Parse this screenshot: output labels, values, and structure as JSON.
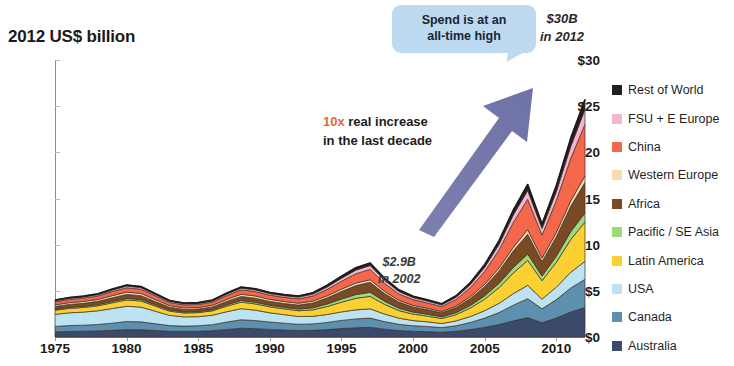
{
  "title": "2012 US$ billion",
  "annotations": {
    "callout": "Spend is at an\nall-time high",
    "callout_line1": "Spend is at an",
    "callout_line2": "all-time high",
    "peak_value": "$30B",
    "peak_year": "in 2012",
    "trough_value": "$2.9B",
    "trough_year": "in 2002",
    "increase_highlight": "10x",
    "increase_rest": " real increase",
    "increase_line2": "in the last decade",
    "arrow": "up-right-arrow"
  },
  "legend": {
    "items": [
      {
        "label": "Rest of World",
        "color": "#231f20"
      },
      {
        "label": "FSU + E Europe",
        "color": "#f4b6cd"
      },
      {
        "label": "China",
        "color": "#f4674a"
      },
      {
        "label": "Western Europe",
        "color": "#f6dcb0"
      },
      {
        "label": "Africa",
        "color": "#7a4a25"
      },
      {
        "label": "Pacific / SE Asia",
        "color": "#9ddb7a"
      },
      {
        "label": "Latin America",
        "color": "#fbd032"
      },
      {
        "label": "USA",
        "color": "#bde2f2"
      },
      {
        "label": "Canada",
        "color": "#5d8fae"
      },
      {
        "label": "Australia",
        "color": "#3b4a6b"
      }
    ]
  },
  "chart_data": {
    "type": "area",
    "stacked": true,
    "title": "2012 US$ billion",
    "xlabel": "",
    "ylabel": "2012 US$ billion",
    "ylim": [
      0,
      30
    ],
    "xlim": [
      1975,
      2012
    ],
    "ytick_labels": [
      "$0",
      "$5",
      "$10",
      "$15",
      "$20",
      "$25",
      "$30"
    ],
    "ytick_values": [
      0,
      5,
      10,
      15,
      20,
      25,
      30
    ],
    "xtick_labels": [
      "1975",
      "1980",
      "1985",
      "1990",
      "1995",
      "2000",
      "2005",
      "2010"
    ],
    "xtick_values": [
      1975,
      1980,
      1985,
      1990,
      1995,
      2000,
      2005,
      2010
    ],
    "grid": false,
    "legend_position": "right",
    "x": [
      1975,
      1976,
      1977,
      1978,
      1979,
      1980,
      1981,
      1982,
      1983,
      1984,
      1985,
      1986,
      1987,
      1988,
      1989,
      1990,
      1991,
      1992,
      1993,
      1994,
      1995,
      1996,
      1997,
      1998,
      1999,
      2000,
      2001,
      2002,
      2003,
      2004,
      2005,
      2006,
      2007,
      2008,
      2009,
      2010,
      2011,
      2012
    ],
    "series": [
      {
        "name": "Australia",
        "color": "#3b4a6b",
        "values": [
          0.55,
          0.6,
          0.62,
          0.66,
          0.72,
          0.8,
          0.78,
          0.7,
          0.62,
          0.6,
          0.62,
          0.68,
          0.82,
          0.95,
          0.9,
          0.82,
          0.76,
          0.7,
          0.72,
          0.8,
          0.92,
          1.0,
          1.05,
          0.85,
          0.7,
          0.62,
          0.58,
          0.52,
          0.62,
          0.8,
          1.05,
          1.35,
          1.75,
          2.1,
          1.55,
          2.05,
          2.7,
          3.2
        ]
      },
      {
        "name": "Canada",
        "color": "#5d8fae",
        "values": [
          0.6,
          0.64,
          0.66,
          0.7,
          0.78,
          0.88,
          0.86,
          0.74,
          0.62,
          0.58,
          0.6,
          0.66,
          0.8,
          0.92,
          0.88,
          0.8,
          0.74,
          0.68,
          0.7,
          0.78,
          0.88,
          0.96,
          1.0,
          0.82,
          0.68,
          0.6,
          0.56,
          0.5,
          0.6,
          0.78,
          1.0,
          1.3,
          1.7,
          2.05,
          1.5,
          2.0,
          2.6,
          3.05
        ]
      },
      {
        "name": "USA",
        "color": "#bde2f2",
        "values": [
          1.3,
          1.38,
          1.42,
          1.48,
          1.58,
          1.65,
          1.6,
          1.35,
          1.1,
          1.0,
          0.98,
          1.02,
          1.12,
          1.2,
          1.12,
          1.0,
          0.92,
          0.84,
          0.82,
          0.86,
          0.92,
          0.98,
          1.0,
          0.82,
          0.66,
          0.56,
          0.5,
          0.44,
          0.52,
          0.64,
          0.8,
          1.0,
          1.25,
          1.45,
          1.05,
          1.35,
          1.7,
          1.95
        ]
      },
      {
        "name": "Latin America",
        "color": "#fbd032",
        "values": [
          0.45,
          0.48,
          0.5,
          0.54,
          0.62,
          0.68,
          0.66,
          0.56,
          0.46,
          0.42,
          0.44,
          0.48,
          0.6,
          0.7,
          0.68,
          0.64,
          0.62,
          0.62,
          0.7,
          0.86,
          1.05,
          1.25,
          1.35,
          1.05,
          0.82,
          0.7,
          0.62,
          0.54,
          0.68,
          0.92,
          1.25,
          1.7,
          2.25,
          2.7,
          2.0,
          2.7,
          3.55,
          4.25
        ]
      },
      {
        "name": "Pacific / SE Asia",
        "color": "#9ddb7a",
        "values": [
          0.1,
          0.11,
          0.12,
          0.13,
          0.15,
          0.16,
          0.16,
          0.14,
          0.12,
          0.11,
          0.11,
          0.12,
          0.15,
          0.18,
          0.18,
          0.17,
          0.17,
          0.18,
          0.22,
          0.28,
          0.34,
          0.4,
          0.44,
          0.34,
          0.26,
          0.22,
          0.2,
          0.18,
          0.22,
          0.28,
          0.36,
          0.46,
          0.58,
          0.68,
          0.5,
          0.66,
          0.85,
          1.0
        ]
      },
      {
        "name": "Africa",
        "color": "#7a4a25",
        "values": [
          0.3,
          0.32,
          0.33,
          0.35,
          0.4,
          0.44,
          0.42,
          0.36,
          0.3,
          0.28,
          0.28,
          0.3,
          0.38,
          0.44,
          0.44,
          0.42,
          0.42,
          0.44,
          0.52,
          0.66,
          0.82,
          0.98,
          1.08,
          0.84,
          0.66,
          0.56,
          0.5,
          0.44,
          0.55,
          0.74,
          1.0,
          1.35,
          1.8,
          2.15,
          1.58,
          2.1,
          2.75,
          3.3
        ]
      },
      {
        "name": "Western Europe",
        "color": "#f6dcb0",
        "values": [
          0.18,
          0.19,
          0.2,
          0.21,
          0.23,
          0.25,
          0.24,
          0.21,
          0.18,
          0.17,
          0.17,
          0.18,
          0.21,
          0.24,
          0.24,
          0.22,
          0.21,
          0.2,
          0.2,
          0.22,
          0.25,
          0.27,
          0.28,
          0.23,
          0.19,
          0.17,
          0.15,
          0.14,
          0.16,
          0.2,
          0.25,
          0.32,
          0.4,
          0.48,
          0.36,
          0.46,
          0.58,
          0.7
        ]
      },
      {
        "name": "China",
        "color": "#f4674a",
        "values": [
          0.32,
          0.34,
          0.36,
          0.38,
          0.44,
          0.48,
          0.46,
          0.4,
          0.34,
          0.32,
          0.32,
          0.34,
          0.42,
          0.48,
          0.48,
          0.46,
          0.46,
          0.48,
          0.56,
          0.7,
          0.86,
          1.02,
          1.12,
          0.88,
          0.7,
          0.62,
          0.58,
          0.54,
          0.72,
          1.0,
          1.4,
          1.95,
          2.7,
          3.3,
          2.5,
          3.45,
          4.6,
          5.6
        ]
      },
      {
        "name": "FSU + E Europe",
        "color": "#f4b6cd",
        "values": [
          0.12,
          0.13,
          0.13,
          0.14,
          0.16,
          0.18,
          0.17,
          0.15,
          0.13,
          0.12,
          0.12,
          0.13,
          0.16,
          0.18,
          0.18,
          0.17,
          0.17,
          0.18,
          0.21,
          0.26,
          0.32,
          0.38,
          0.42,
          0.33,
          0.26,
          0.22,
          0.2,
          0.18,
          0.24,
          0.32,
          0.44,
          0.6,
          0.8,
          0.96,
          0.72,
          0.98,
          1.3,
          1.6
        ]
      },
      {
        "name": "Rest of World",
        "color": "#231f20",
        "values": [
          0.08,
          0.09,
          0.09,
          0.1,
          0.11,
          0.12,
          0.12,
          0.1,
          0.09,
          0.08,
          0.08,
          0.09,
          0.11,
          0.13,
          0.12,
          0.12,
          0.12,
          0.12,
          0.14,
          0.18,
          0.22,
          0.26,
          0.28,
          0.22,
          0.18,
          0.15,
          0.14,
          0.12,
          0.16,
          0.22,
          0.3,
          0.4,
          0.54,
          0.65,
          0.48,
          0.66,
          0.88,
          1.08
        ]
      }
    ],
    "totals": [
      4.0,
      4.28,
      4.43,
      4.69,
      5.19,
      5.64,
      5.47,
      4.71,
      3.96,
      3.68,
      3.72,
      4.0,
      4.77,
      5.42,
      5.22,
      4.82,
      4.59,
      4.44,
      4.79,
      5.6,
      6.58,
      7.5,
      8.02,
      6.38,
      5.11,
      4.42,
      4.03,
      3.6,
      4.47,
      5.9,
      7.85,
      10.43,
      13.77,
      16.52,
      12.24,
      16.41,
      21.51,
      25.73
    ]
  }
}
